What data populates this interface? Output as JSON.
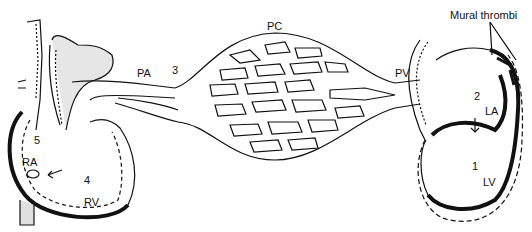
{
  "diagram": {
    "labels": {
      "pa": "PA",
      "three": "3",
      "pc": "PC",
      "pv": "PV",
      "mural_thrombi": "Mural thrombi",
      "two": "2",
      "la": "LA",
      "one": "1",
      "lv": "LV",
      "five": "5",
      "ra": "RA",
      "four": "4",
      "rv": "RV"
    },
    "colors": {
      "ink": "#111111",
      "shade": "#d8d8d8",
      "background": "#ffffff"
    }
  }
}
